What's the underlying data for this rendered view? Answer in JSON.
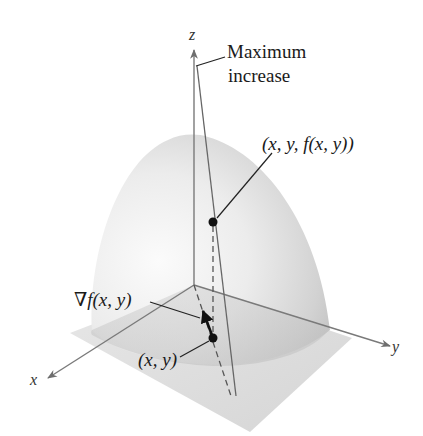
{
  "figure": {
    "axes": {
      "x_label": "x",
      "y_label": "y",
      "z_label": "z"
    },
    "annotations": {
      "max_increase_line1": "Maximum",
      "max_increase_line2": "increase",
      "surface_point": "(x, y, f(x, y))",
      "gradient": "∇f(x, y)",
      "base_point": "(x, y)"
    },
    "colors": {
      "axis": "#6e6e6e",
      "leader": "#2a2a2a",
      "point": "#111111",
      "surface_light": "#f4f4f4",
      "surface_dark": "#bdbdbd",
      "plane": "#d6d6d6"
    }
  }
}
